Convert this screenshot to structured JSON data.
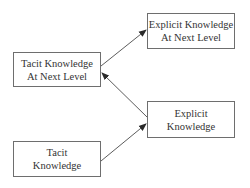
{
  "diagram": {
    "nodes": [
      {
        "id": "tacit_next",
        "lines": [
          "Tacit Knowledge",
          "At Next Level"
        ]
      },
      {
        "id": "explicit_next",
        "lines": [
          "Explicit Knowledge",
          "At Next Level"
        ]
      },
      {
        "id": "explicit",
        "lines": [
          "Explicit",
          "Knowledge"
        ]
      },
      {
        "id": "tacit",
        "lines": [
          "Tacit",
          "Knowledge"
        ]
      }
    ],
    "edges": [
      {
        "from": "tacit_next",
        "to": "explicit_next"
      },
      {
        "from": "explicit",
        "to": "tacit_next"
      },
      {
        "from": "tacit",
        "to": "explicit"
      }
    ],
    "colors": {
      "line": "#4a4a4a",
      "border": "#6e6e6e",
      "text": "#333333",
      "background": "#ffffff"
    }
  }
}
